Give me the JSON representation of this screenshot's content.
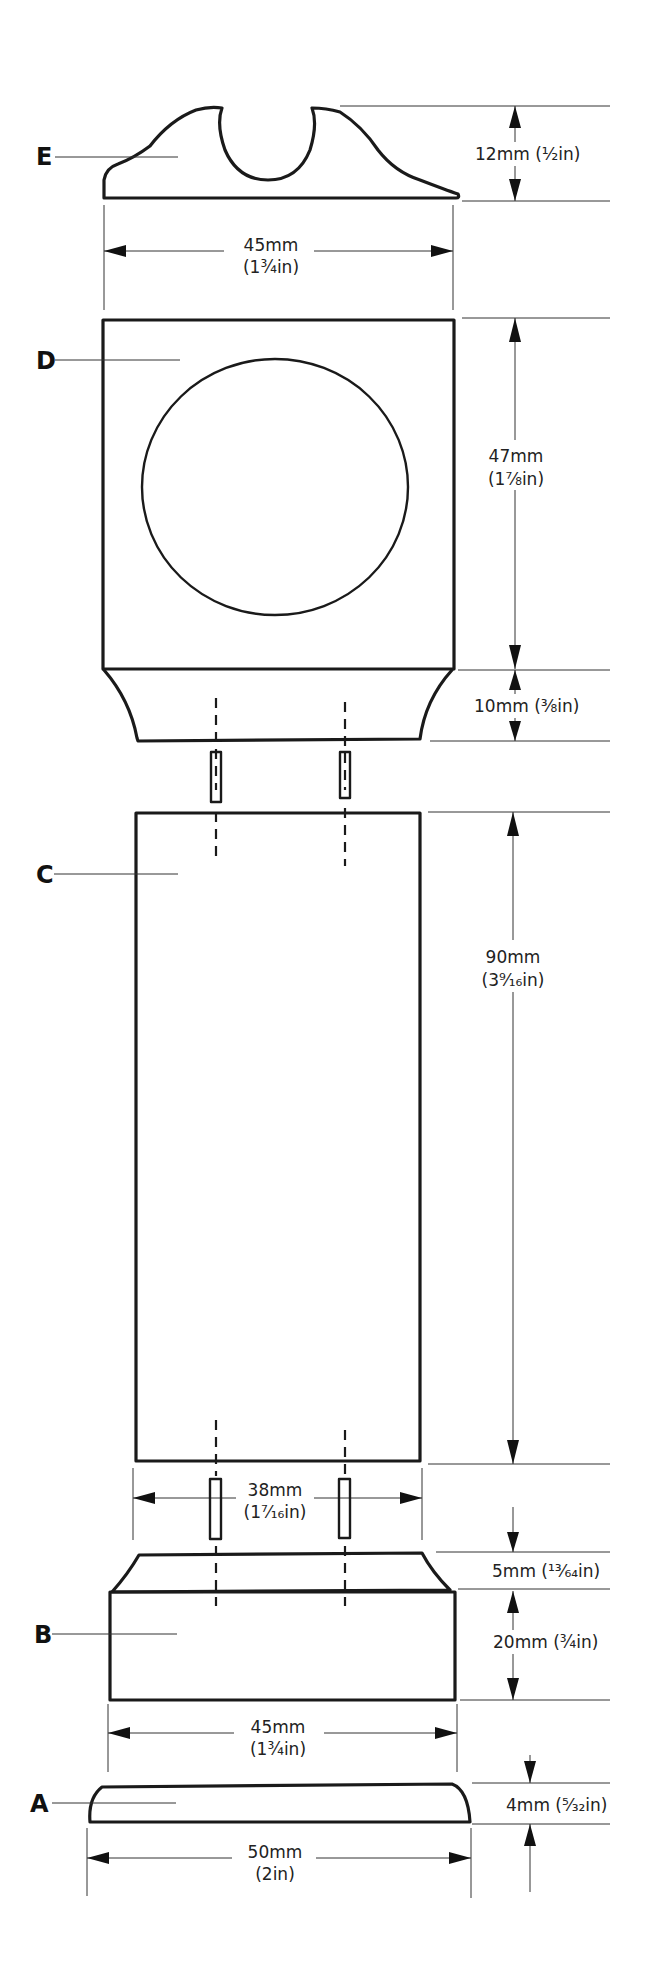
{
  "diagram": {
    "type": "exploded-assembly-drawing",
    "parts": [
      {
        "id": "E",
        "label": "E",
        "name": "top cap with semicircular cradle"
      },
      {
        "id": "D",
        "label": "D",
        "name": "square block with circular face and flared base"
      },
      {
        "id": "C",
        "label": "C",
        "name": "tall rectangular column"
      },
      {
        "id": "B",
        "label": "B",
        "name": "base block with chamfered top"
      },
      {
        "id": "A",
        "label": "A",
        "name": "thin plinth plate"
      }
    ],
    "dimensions": {
      "e_height": {
        "mm": "12mm",
        "in": "(½in)",
        "text": "12mm (½in)"
      },
      "e_width": {
        "mm": "45mm",
        "in": "(1¾in)"
      },
      "d_height": {
        "mm": "47mm",
        "in": "(1⅞in)"
      },
      "d_base_height": {
        "mm": "10mm",
        "in": "(⅜in)",
        "text": "10mm (⅜in)"
      },
      "c_height": {
        "mm": "90mm",
        "in": "(3⁹⁄₁₆in)"
      },
      "c_width": {
        "mm": "38mm",
        "in": "(1⁷⁄₁₆in)"
      },
      "b_chamfer_height": {
        "mm": "5mm",
        "in": "(¹³⁄₆₄in)",
        "text": "5mm (¹³⁄₆₄in)"
      },
      "b_height": {
        "mm": "20mm",
        "in": "(¾in)",
        "text": "20mm (¾in)"
      },
      "b_width": {
        "mm": "45mm",
        "in": "(1¾in)"
      },
      "a_height": {
        "mm": "4mm",
        "in": "(⁵⁄₃₂in)",
        "text": "4mm (⁵⁄₃₂in)"
      },
      "a_width": {
        "mm": "50mm",
        "in": "(2in)"
      }
    },
    "connectors": [
      {
        "name": "dowel-left-upper",
        "between": [
          "D",
          "C"
        ]
      },
      {
        "name": "dowel-right-upper",
        "between": [
          "D",
          "C"
        ]
      },
      {
        "name": "dowel-left-lower",
        "between": [
          "C",
          "B"
        ]
      },
      {
        "name": "dowel-right-lower",
        "between": [
          "C",
          "B"
        ]
      }
    ]
  }
}
